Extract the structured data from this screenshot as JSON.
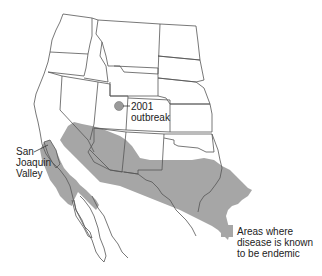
{
  "map": {
    "region": "Western United States and northern Mexico",
    "colors": {
      "endemic_fill": "#a6a6a6",
      "outbreak_marker": "#9a9a9a",
      "borders": "#555555",
      "background": "#ffffff"
    },
    "annotations": {
      "outbreak": {
        "line1": "2001",
        "line2": "outbreak"
      },
      "valley": {
        "line1": "San",
        "line2": "Joaquin",
        "line3": "Valley"
      }
    },
    "legend": {
      "line1": "Areas where",
      "line2": "disease is known",
      "line3": "to be endemic"
    }
  }
}
